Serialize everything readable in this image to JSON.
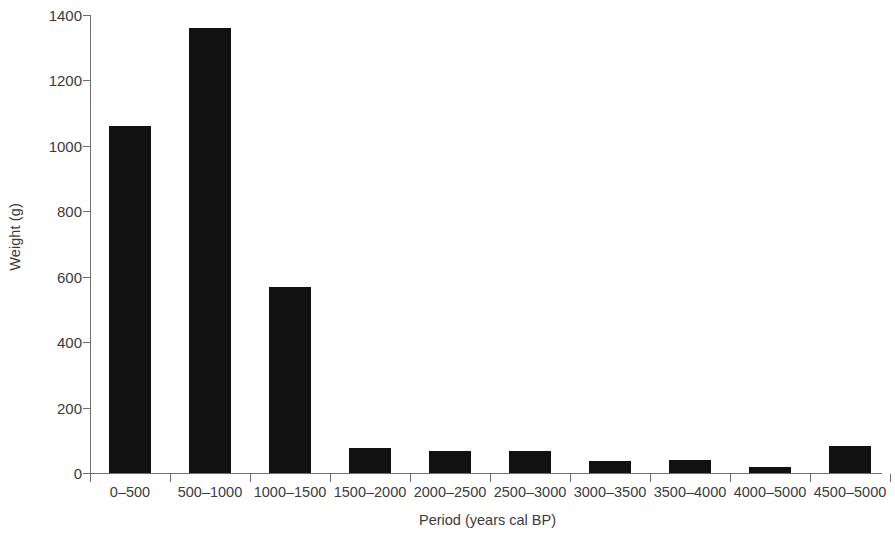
{
  "chart_data": {
    "type": "bar",
    "title": "",
    "xlabel": "Period (years cal BP)",
    "ylabel": "Weight (g)",
    "categories": [
      "0–500",
      "500–1000",
      "1000–1500",
      "1500–2000",
      "2000–2500",
      "2500–3000",
      "3000–3500",
      "3500–4000",
      "4000–5000",
      "4500–5000"
    ],
    "values": [
      1060,
      1360,
      569,
      76,
      67,
      67,
      37,
      40,
      18,
      82
    ],
    "ylim": [
      0,
      1400
    ],
    "y_ticks": [
      0,
      200,
      400,
      600,
      800,
      1000,
      1200,
      1400
    ],
    "y_tick_labels": [
      "0",
      "200",
      "400",
      "600",
      "800",
      "1000",
      "1200",
      "1400"
    ],
    "grid": false,
    "legend": null,
    "bar_color": "#111111",
    "axis_color": "#6e6e6e",
    "text_color": "#3b3b3b"
  }
}
